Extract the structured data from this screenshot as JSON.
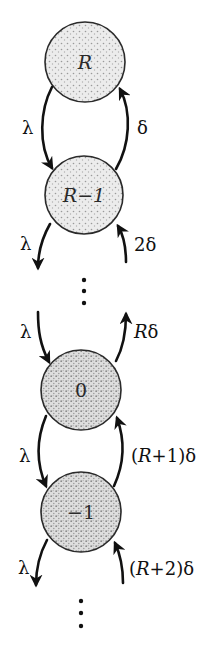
{
  "diagram": {
    "type": "birth-death chain",
    "states": [
      {
        "id": "R",
        "label": "R",
        "cx": 85,
        "cy": 62,
        "r": 40
      },
      {
        "id": "R-1",
        "label": "R−1",
        "cx": 84,
        "cy": 195,
        "r": 39
      },
      {
        "id": "0",
        "label": "0",
        "cx": 81,
        "cy": 390,
        "r": 40
      },
      {
        "id": "-1",
        "label": "−1",
        "cx": 81,
        "cy": 512,
        "r": 40
      }
    ],
    "transitions": [
      {
        "from": "R",
        "to": "R-1",
        "label": "λ",
        "side": "left"
      },
      {
        "from": "R-1",
        "to": "R",
        "label": "δ",
        "side": "right"
      },
      {
        "from": "R-1",
        "to": "below",
        "label": "λ",
        "side": "left"
      },
      {
        "from": "below",
        "to": "R-1",
        "label": "2δ",
        "side": "right"
      },
      {
        "from": "above",
        "to": "0",
        "label": "λ",
        "side": "left"
      },
      {
        "from": "0",
        "to": "above",
        "label": "Rδ",
        "side": "right"
      },
      {
        "from": "0",
        "to": "-1",
        "label": "λ",
        "side": "left"
      },
      {
        "from": "-1",
        "to": "0",
        "label": "(R+1)δ",
        "side": "right"
      },
      {
        "from": "-1",
        "to": "below",
        "label": "λ",
        "side": "left"
      },
      {
        "from": "below",
        "to": "-1",
        "label": "(R+2)δ",
        "side": "right"
      }
    ],
    "labels": {
      "lambda": "λ",
      "delta": "δ",
      "two_delta": "2δ",
      "R_delta_R": "R",
      "R_delta_d": "δ",
      "r1_open": "(",
      "r1_R": "R",
      "r1_rest": "+1)δ",
      "r2_open": "(",
      "r2_R": "R",
      "r2_rest": "+2)δ"
    },
    "ellipsis": "⋮",
    "colors": {
      "ink": "#111111",
      "fill": "#d9d9d9",
      "background": "#ffffff"
    }
  }
}
